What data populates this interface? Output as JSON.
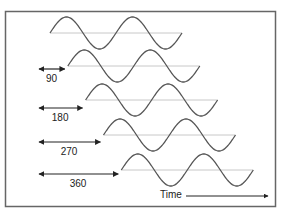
{
  "diagram": {
    "time_label": "Time",
    "colors": {
      "wave": "#555555",
      "axis": "#c8c8c8",
      "arrow": "#222222",
      "border": "#666666"
    },
    "waves": [
      {
        "phase_shift": 0,
        "label": ""
      },
      {
        "phase_shift": 90,
        "label": "90"
      },
      {
        "phase_shift": 180,
        "label": "180"
      },
      {
        "phase_shift": 270,
        "label": "270"
      },
      {
        "phase_shift": 360,
        "label": "360"
      }
    ]
  }
}
